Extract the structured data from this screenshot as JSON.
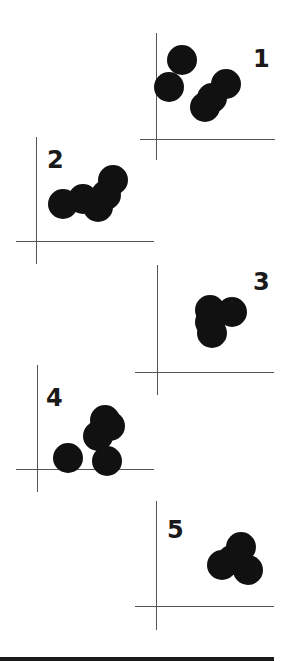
{
  "figure": {
    "colors": {
      "dot": "#111111",
      "axis": "#555555",
      "label": "#1a1a1a",
      "background": "#ffffff"
    },
    "panels": [
      {
        "label": "1",
        "label_pos": [
          253,
          47
        ],
        "axis_v": {
          "x": 156,
          "y1": 33,
          "y2": 160
        },
        "axis_h": {
          "y": 139,
          "x1": 140,
          "x2": 275
        },
        "dots": [
          [
            182,
            60
          ],
          [
            169,
            87
          ],
          [
            226,
            84
          ],
          [
            212,
            98
          ],
          [
            205,
            107
          ]
        ],
        "radius": 15
      },
      {
        "label": "2",
        "label_pos": [
          47,
          148
        ],
        "axis_v": {
          "x": 36,
          "y1": 137,
          "y2": 264
        },
        "axis_h": {
          "y": 241,
          "x1": 16,
          "x2": 154
        },
        "dots": [
          [
            63,
            204
          ],
          [
            83,
            199
          ],
          [
            98,
            207
          ],
          [
            106,
            195
          ],
          [
            113,
            180
          ]
        ],
        "radius": 15
      },
      {
        "label": "3",
        "label_pos": [
          253,
          270
        ],
        "axis_v": {
          "x": 157,
          "y1": 265,
          "y2": 395
        },
        "axis_h": {
          "y": 372,
          "x1": 135,
          "x2": 274
        },
        "dots": [
          [
            210,
            310
          ],
          [
            232,
            312
          ],
          [
            212,
            333
          ],
          [
            210,
            322
          ]
        ],
        "radius": 15
      },
      {
        "label": "4",
        "label_pos": [
          46,
          386
        ],
        "axis_v": {
          "x": 37,
          "y1": 365,
          "y2": 492
        },
        "axis_h": {
          "y": 469,
          "x1": 16,
          "x2": 154
        },
        "dots": [
          [
            68,
            458
          ],
          [
            105,
            420
          ],
          [
            110,
            426
          ],
          [
            98,
            436
          ],
          [
            107,
            461
          ]
        ],
        "radius": 15
      },
      {
        "label": "5",
        "label_pos": [
          167,
          518
        ],
        "axis_v": {
          "x": 156,
          "y1": 501,
          "y2": 630
        },
        "axis_h": {
          "y": 606,
          "x1": 135,
          "x2": 274
        },
        "dots": [
          [
            222,
            565
          ],
          [
            241,
            547
          ],
          [
            248,
            570
          ],
          [
            232,
            560
          ]
        ],
        "radius": 15
      }
    ]
  }
}
